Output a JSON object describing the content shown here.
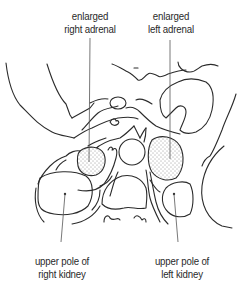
{
  "diagram": {
    "type": "anatomical line drawing (axial section, upper abdomen)",
    "labels": {
      "right_adrenal": {
        "line1": "enlarged",
        "line2": "right adrenal"
      },
      "left_adrenal": {
        "line1": "enlarged",
        "line2": "left adrenal"
      },
      "right_kidney": {
        "line1": "upper pole of",
        "line2": "right kidney"
      },
      "left_kidney": {
        "line1": "upper pole of",
        "line2": "left kidney"
      }
    },
    "colors": {
      "line": "#2b2b2b",
      "background": "#ffffff",
      "stipple": "#333333"
    }
  }
}
